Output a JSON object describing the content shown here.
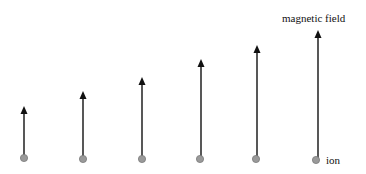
{
  "diagram": {
    "labels": {
      "field": "magnetic field",
      "particle": "ion"
    },
    "colors": {
      "arrow": "#111111",
      "ion_fill": "#9a9a9a",
      "ion_stroke": "#7a7a7a",
      "text": "#111111"
    },
    "arrows": [
      {
        "x": 24,
        "tip_y": 106,
        "base_y": 158
      },
      {
        "x": 83,
        "tip_y": 91,
        "base_y": 159
      },
      {
        "x": 142,
        "tip_y": 77,
        "base_y": 159
      },
      {
        "x": 201,
        "tip_y": 59,
        "base_y": 159
      },
      {
        "x": 257,
        "tip_y": 45,
        "base_y": 159
      },
      {
        "x": 318,
        "tip_y": 30,
        "base_y": 159
      }
    ],
    "ions": [
      {
        "x": 24,
        "y": 158
      },
      {
        "x": 83,
        "y": 159
      },
      {
        "x": 142,
        "y": 159
      },
      {
        "x": 200,
        "y": 159
      },
      {
        "x": 256,
        "y": 159
      },
      {
        "x": 316,
        "y": 160
      }
    ]
  }
}
